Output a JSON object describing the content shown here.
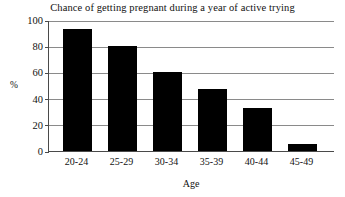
{
  "chart_data": {
    "type": "bar",
    "title": "Chance of getting pregnant during a year of active trying",
    "xlabel": "Age",
    "ylabel": "%",
    "categories": [
      "20-24",
      "25-29",
      "30-34",
      "35-39",
      "40-44",
      "45-49"
    ],
    "values": [
      93,
      80,
      60,
      47,
      33,
      5
    ],
    "ylim": [
      0,
      100
    ],
    "yticks": [
      0,
      20,
      40,
      60,
      80,
      100
    ],
    "ytick_labels": [
      "0",
      "20",
      "40",
      "60",
      "80",
      "100"
    ],
    "grid": true,
    "grid_axis": "y",
    "legend": false,
    "bar_color": "#000000",
    "grid_color": "#8a8a8a",
    "axis_color": "#4a4a4a",
    "background": "#ffffff"
  }
}
